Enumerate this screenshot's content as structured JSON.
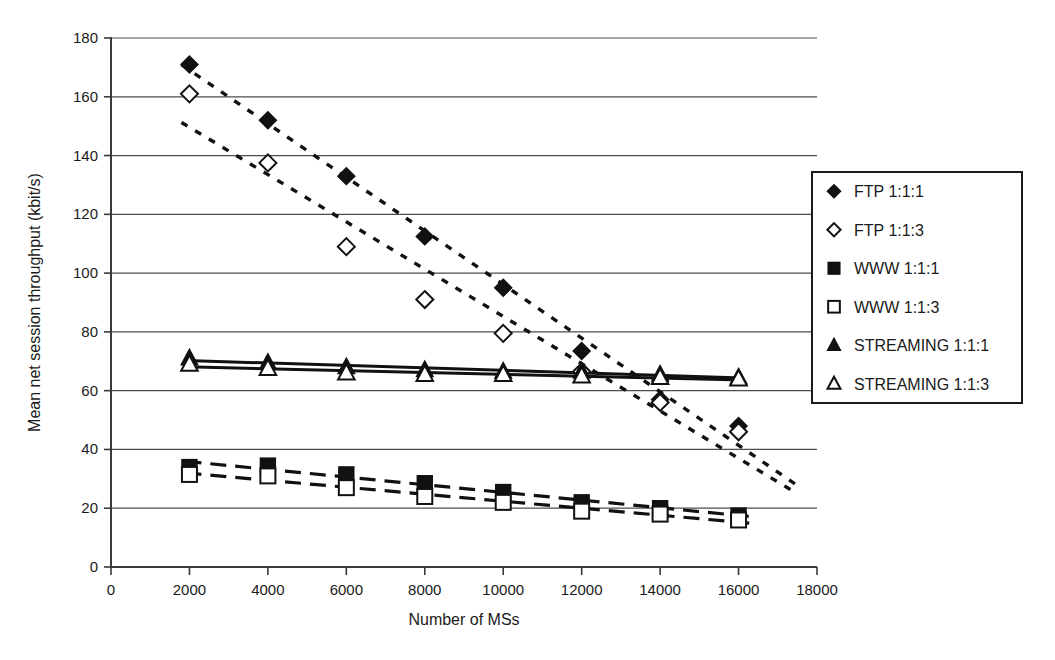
{
  "chart_data": {
    "type": "line",
    "title": "",
    "subtitle": "",
    "xlabel": "Number of MSs",
    "ylabel": "Mean net session throughput (kbit/s)",
    "xlim": [
      0,
      18000
    ],
    "ylim": [
      0,
      180
    ],
    "xticks": [
      0,
      2000,
      4000,
      6000,
      8000,
      10000,
      12000,
      14000,
      16000,
      18000
    ],
    "yticks": [
      0,
      20,
      40,
      60,
      80,
      100,
      120,
      140,
      160,
      180
    ],
    "xtick_labels": [
      "0",
      "2000",
      "4000",
      "6000",
      "8000",
      "10000",
      "12000",
      "14000",
      "16000",
      "18000"
    ],
    "ytick_labels": [
      "0",
      "20",
      "40",
      "60",
      "80",
      "100",
      "120",
      "140",
      "160",
      "180"
    ],
    "grid": "horizontal",
    "legend_position": "right-outside",
    "x": [
      2000,
      4000,
      6000,
      8000,
      10000,
      12000,
      14000,
      16000
    ],
    "series": [
      {
        "name": "FTP 1:1:1",
        "marker": "diamond-filled",
        "line_style": "dotted",
        "values": [
          171,
          152,
          133,
          112.5,
          95,
          73.5,
          57,
          48
        ]
      },
      {
        "name": "FTP 1:1:3",
        "marker": "diamond-open",
        "line_style": "dotted",
        "values": [
          161,
          137.5,
          109,
          91,
          79.5,
          66.5,
          56,
          46
        ]
      },
      {
        "name": "WWW 1:1:1",
        "marker": "square-filled",
        "line_style": "dashed",
        "values": [
          34,
          34.5,
          31.5,
          28.5,
          25.5,
          22,
          20,
          17.5
        ]
      },
      {
        "name": "WWW 1:1:3",
        "marker": "square-open",
        "line_style": "dashed",
        "values": [
          31.5,
          31,
          27,
          24,
          22,
          19,
          18,
          16
        ]
      },
      {
        "name": "STREAMING 1:1:1",
        "marker": "triangle-filled",
        "line_style": "solid",
        "values": [
          71,
          69.5,
          68,
          67,
          66.5,
          66.5,
          65.5,
          64.5
        ]
      },
      {
        "name": "STREAMING 1:1:3",
        "marker": "triangle-open",
        "line_style": "solid",
        "values": [
          69,
          67.5,
          66,
          65.5,
          65.5,
          65,
          64.5,
          64
        ]
      }
    ]
  },
  "legend": {
    "items": [
      {
        "label": "FTP 1:1:1",
        "marker": "diamond-filled"
      },
      {
        "label": "FTP 1:1:3",
        "marker": "diamond-open"
      },
      {
        "label": "WWW 1:1:1",
        "marker": "square-filled"
      },
      {
        "label": "WWW 1:1:3",
        "marker": "square-open"
      },
      {
        "label": "STREAMING 1:1:1",
        "marker": "triangle-filled"
      },
      {
        "label": "STREAMING 1:1:3",
        "marker": "triangle-open"
      }
    ]
  },
  "colors": {
    "ink": "#111111",
    "grid": "#4d4d4d",
    "background": "#ffffff"
  }
}
